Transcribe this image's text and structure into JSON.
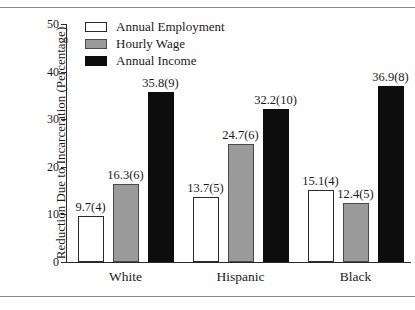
{
  "chart_data": {
    "type": "bar",
    "title": "",
    "subtitle": "",
    "xlabel": "",
    "ylabel": "Reduction Due to Incarceration (Percentage)",
    "categories": [
      "White",
      "Hispanic",
      "Black"
    ],
    "ylim": [
      0,
      50
    ],
    "yticks": [
      0,
      10,
      20,
      30,
      40,
      50
    ],
    "ytick_labels": [
      "0",
      "10",
      "20",
      "30",
      "40",
      "50"
    ],
    "grid": false,
    "legend_position": "top-left",
    "series": [
      {
        "name": "Annual Employment",
        "color": "#ffffff",
        "values": [
          9.7,
          13.7,
          15.1
        ],
        "errors": [
          0.4,
          0.5,
          0.4
        ],
        "labels": [
          "9.7(4)",
          "13.7(5)",
          "15.1(4)"
        ]
      },
      {
        "name": "Hourly Wage",
        "color": "#9a9a9a",
        "values": [
          16.3,
          24.7,
          12.4
        ],
        "errors": [
          0.6,
          0.6,
          0.5
        ],
        "labels": [
          "16.3(6)",
          "24.7(6)",
          "12.4(5)"
        ]
      },
      {
        "name": "Annual Income",
        "color": "#0d0d0d",
        "values": [
          35.8,
          32.2,
          36.9
        ],
        "errors": [
          0.9,
          1.0,
          0.8
        ],
        "labels": [
          "35.8(9)",
          "32.2(10)",
          "36.9(8)"
        ]
      }
    ]
  },
  "legend": {
    "items": [
      {
        "label": "Annual Employment",
        "swatch": "employment"
      },
      {
        "label": "Hourly Wage",
        "swatch": "wage"
      },
      {
        "label": "Annual Income",
        "swatch": "income"
      }
    ]
  },
  "axis": {
    "y_title": "Reduction Due to Incarceration (Percentage)"
  },
  "colors": {
    "employment": "#ffffff",
    "wage": "#9a9a9a",
    "income": "#0d0d0d",
    "axis": "#2a2a2a",
    "rule": "#8a8a8a"
  }
}
